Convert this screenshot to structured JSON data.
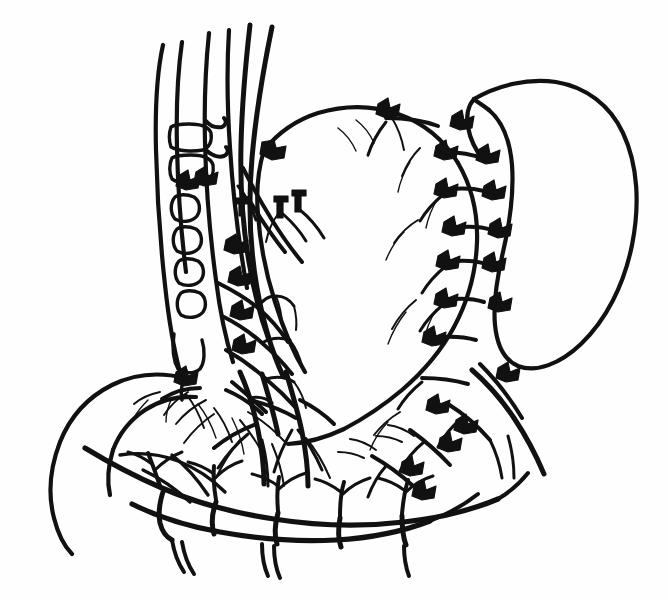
{
  "figure": {
    "style": "black ink line art on white background",
    "width": 668,
    "height": 600,
    "background_color": "#fefefe",
    "ink_color": "#111111",
    "caption": ""
  },
  "structures": [
    {
      "id": "esophagus",
      "label": "Esophagus",
      "region": "upper-center-left"
    },
    {
      "id": "stomach-body",
      "label": "Stomach body",
      "region": "center"
    },
    {
      "id": "greater-curvature",
      "label": "Greater curvature",
      "region": "right"
    },
    {
      "id": "lesser-curvature",
      "label": "Lesser curvature",
      "region": "center-left"
    },
    {
      "id": "spleen",
      "label": "Spleen",
      "region": "right"
    },
    {
      "id": "duodenum",
      "label": "Duodenum",
      "region": "lower-left"
    },
    {
      "id": "pylorus",
      "label": "Pylorus",
      "region": "lower-left-center"
    },
    {
      "id": "left-gastric-artery",
      "label": "Left gastric artery",
      "region": "upper-left"
    },
    {
      "id": "short-gastric-vessels",
      "label": "Short gastric vessels",
      "region": "right"
    },
    {
      "id": "gastroepiploic-arcade",
      "label": "Gastroepiploic arcade",
      "region": "bottom"
    },
    {
      "id": "omental-arcade",
      "label": "Greater omentum arcade",
      "region": "bottom"
    },
    {
      "id": "lymph-node-chain",
      "label": "Perigastric lymph node chain",
      "region": "left"
    },
    {
      "id": "ligature-clips",
      "label": "Surgical ligature clips",
      "region": "distributed"
    }
  ],
  "counts": {
    "ligature_clips": 24,
    "omental_arcade_loops": 4,
    "lymph_nodes": 8
  }
}
